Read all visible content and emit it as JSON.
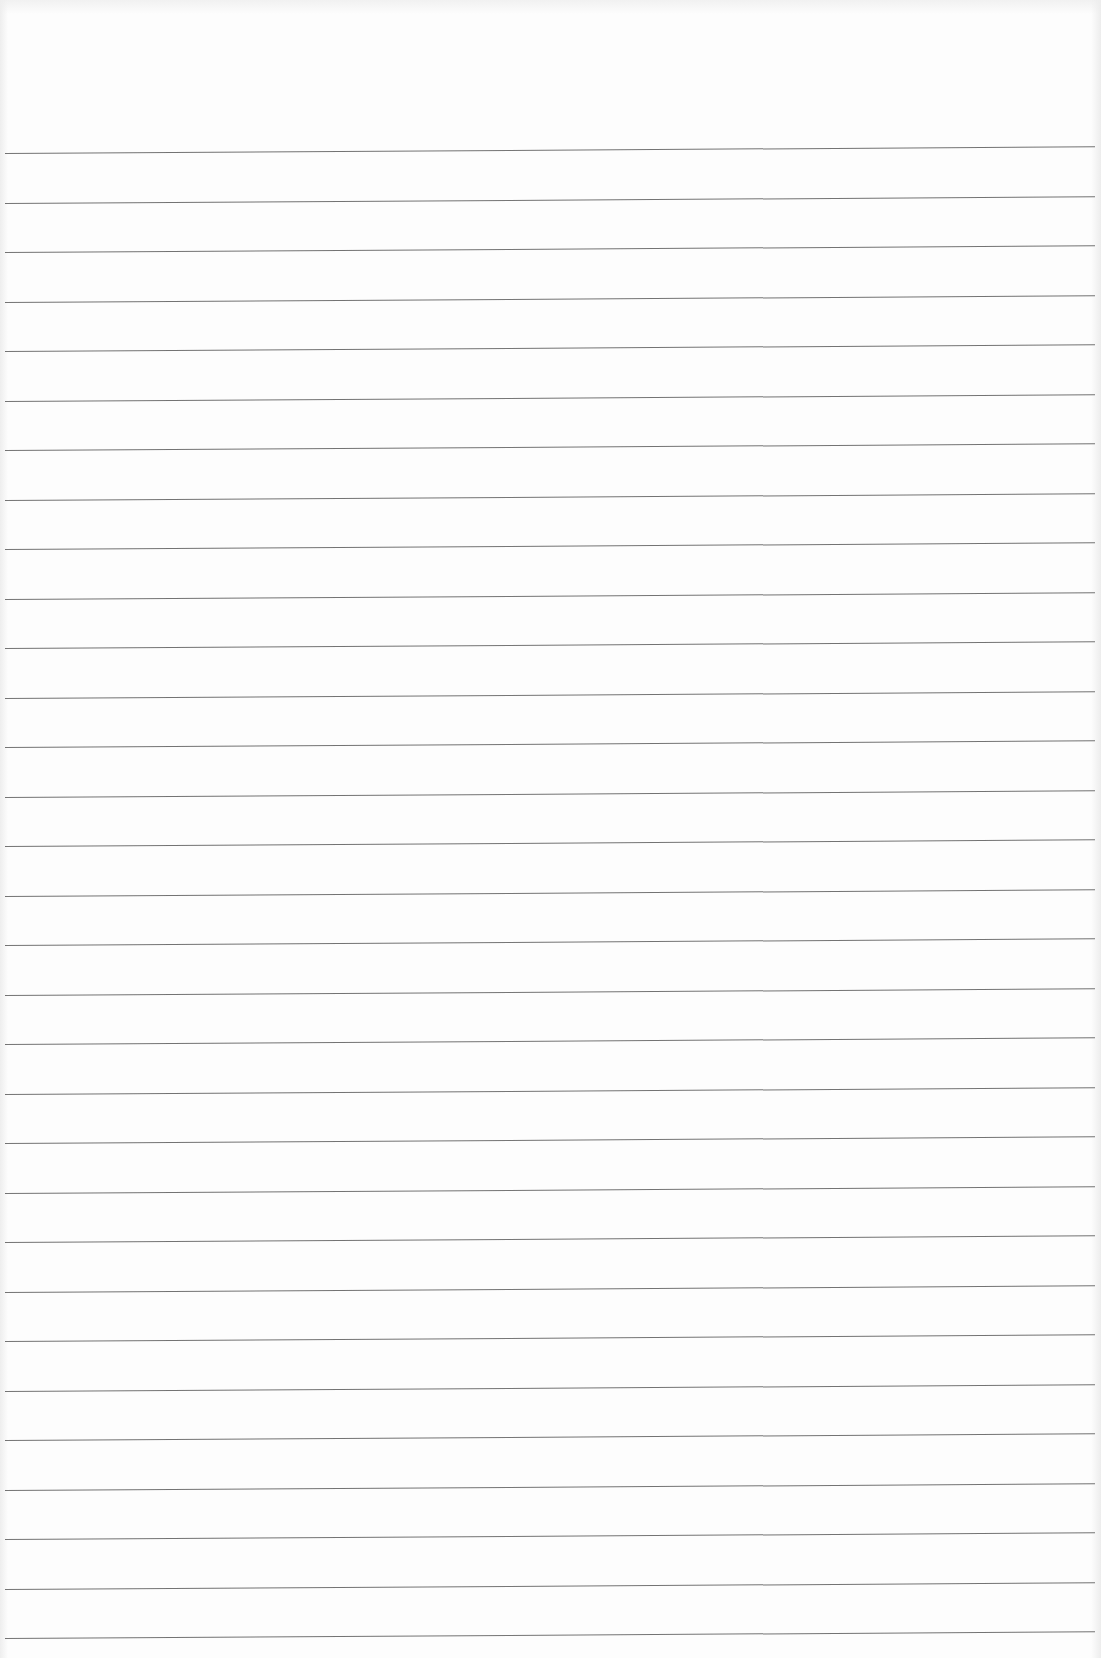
{
  "page": {
    "type": "blank ruled paper",
    "background_color": "#ffffff",
    "line_color": "#5a5a5a",
    "line_count": 31,
    "first_line_y": 153,
    "line_spacing_px": 49.5,
    "line_left_x": 5,
    "line_right_x": 1095,
    "slant_deg": -0.35
  }
}
